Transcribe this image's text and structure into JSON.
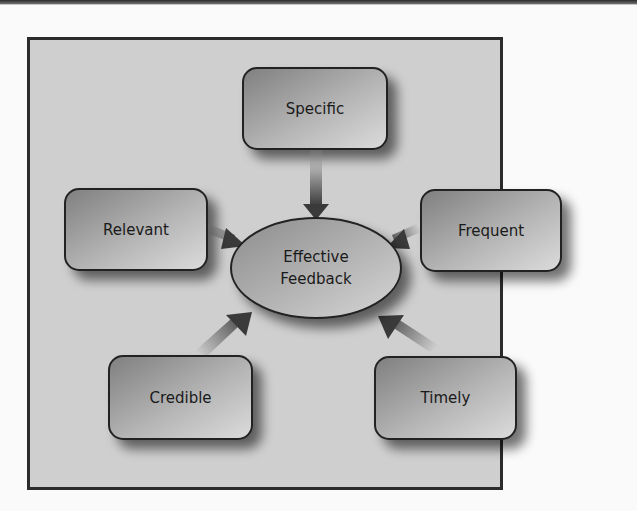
{
  "diagram": {
    "title": "",
    "center": {
      "line1": "Effective",
      "line2": "Feedback"
    },
    "nodes": [
      {
        "id": "specific",
        "label": "Specific"
      },
      {
        "id": "relevant",
        "label": "Relevant"
      },
      {
        "id": "frequent",
        "label": "Frequent"
      },
      {
        "id": "credible",
        "label": "Credible"
      },
      {
        "id": "timely",
        "label": "Timely"
      }
    ],
    "edges": [
      {
        "from": "specific",
        "to": "center"
      },
      {
        "from": "relevant",
        "to": "center"
      },
      {
        "from": "frequent",
        "to": "center"
      },
      {
        "from": "credible",
        "to": "center"
      },
      {
        "from": "timely",
        "to": "center"
      }
    ],
    "colors": {
      "background": "#cfcfcf",
      "border": "#2b2b2b",
      "box_dark": "#8a8a8a",
      "box_light": "#d8d8d8",
      "text": "#1a1a1a"
    }
  }
}
